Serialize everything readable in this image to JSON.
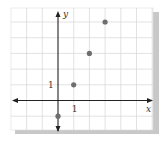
{
  "chart_data": {
    "type": "scatter",
    "title": "",
    "xlabel": "x",
    "ylabel": "y",
    "xlim": [
      -3,
      6
    ],
    "ylim": [
      -2,
      6
    ],
    "grid": true,
    "tick_labels": {
      "x": [
        "1"
      ],
      "y": [
        "1"
      ]
    },
    "series": [
      {
        "name": "points",
        "x": [
          0,
          1,
          2,
          3
        ],
        "y": [
          -1,
          1,
          3,
          5
        ]
      }
    ]
  },
  "colors": {
    "grid": "#d6d6d6",
    "axis": "#222222",
    "point": "#6e6e6e",
    "shadow": "#c8c8c8"
  }
}
